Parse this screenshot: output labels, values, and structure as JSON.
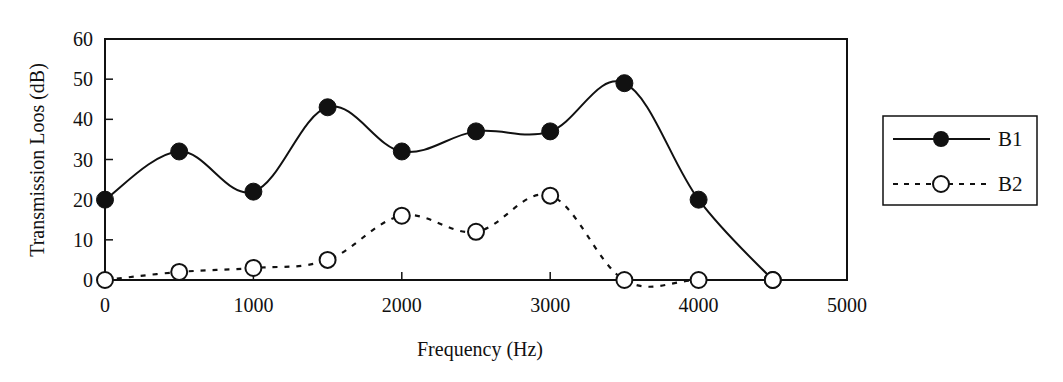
{
  "chart_data": {
    "type": "line",
    "title": "",
    "xlabel": "Frequency (Hz)",
    "ylabel": "Transmission Loos (dB)",
    "xlim": [
      0,
      5000
    ],
    "ylim": [
      0,
      60
    ],
    "xticks": [
      0,
      1000,
      2000,
      3000,
      4000,
      5000
    ],
    "yticks": [
      0,
      10,
      20,
      30,
      40,
      50,
      60
    ],
    "grid": false,
    "legend_position": "right",
    "x": [
      0,
      500,
      1000,
      1500,
      2000,
      2500,
      3000,
      3500,
      4000,
      4500
    ],
    "series": [
      {
        "name": "B1",
        "marker": "filled-circle",
        "line": "solid",
        "values": [
          20,
          32,
          22,
          43,
          32,
          37,
          37,
          49,
          20,
          0
        ]
      },
      {
        "name": "B2",
        "marker": "open-circle",
        "line": "dashed",
        "values": [
          0,
          2,
          3,
          5,
          16,
          12,
          21,
          0,
          0,
          0
        ]
      }
    ]
  },
  "colors": {
    "axis": "#111111",
    "series_b1": "#111111",
    "series_b2": "#111111",
    "marker_b2_fill": "#ffffff"
  }
}
